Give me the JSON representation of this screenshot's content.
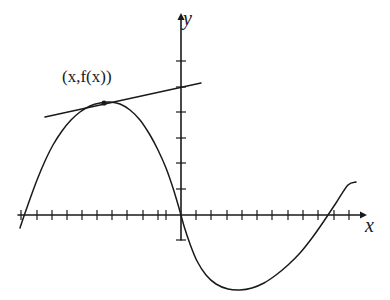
{
  "figure": {
    "background_color": "#ffffff",
    "stroke_color": "#1a1a1a",
    "width": 390,
    "height": 300
  },
  "axes": {
    "x_label": "x",
    "y_label": "y",
    "origin": {
      "x": 181,
      "y": 215
    },
    "x_axis": {
      "start_x": 18,
      "end_x": 360,
      "y": 215,
      "arrow": "right"
    },
    "y_axis": {
      "x": 181,
      "start_y": 240,
      "end_y": 20,
      "arrow": "up"
    },
    "tick_spacing_x": 15.2,
    "tick_spacing_y": 25.5,
    "x_ticks": [
      21,
      37,
      52,
      67,
      82,
      97,
      112,
      127,
      143,
      158,
      166,
      196,
      211,
      227,
      242,
      257,
      272,
      288,
      303,
      318,
      334,
      349
    ],
    "y_ticks_above_axis": [
      189,
      163,
      138,
      112,
      87,
      61
    ],
    "y_ticks_below_axis": [
      240
    ],
    "grid": false,
    "tick_labels": []
  },
  "annotations": {
    "point_label": "(x,f(x))",
    "point_marker": {
      "x": 104,
      "y": 103,
      "radius": 2.6
    },
    "tangent_line": {
      "x1": 45,
      "y1": 117,
      "x2": 201,
      "y2": 83
    }
  },
  "chart_data": {
    "type": "line",
    "title": "",
    "subtitle": "",
    "xlabel": "x",
    "ylabel": "y",
    "grid": false,
    "legend": [],
    "annotations": [
      {
        "text": "(x,f(x))",
        "x": 104,
        "y": 103,
        "kind": "point-label"
      }
    ],
    "series": [
      {
        "name": "f(x)",
        "kind": "curve",
        "points": [
          [
            20,
            228
          ],
          [
            24,
            216
          ],
          [
            30,
            199
          ],
          [
            37,
            180
          ],
          [
            45,
            161
          ],
          [
            53,
            145
          ],
          [
            62,
            131
          ],
          [
            71,
            120
          ],
          [
            80,
            112
          ],
          [
            90,
            106
          ],
          [
            100,
            103
          ],
          [
            110,
            102
          ],
          [
            120,
            104
          ],
          [
            130,
            110
          ],
          [
            140,
            120
          ],
          [
            150,
            135
          ],
          [
            158,
            150
          ],
          [
            166,
            168
          ],
          [
            173,
            188
          ],
          [
            179,
            208
          ],
          [
            184,
            226
          ],
          [
            190,
            244
          ],
          [
            197,
            261
          ],
          [
            206,
            275
          ],
          [
            216,
            284
          ],
          [
            228,
            289
          ],
          [
            240,
            290
          ],
          [
            252,
            288
          ],
          [
            264,
            283
          ],
          [
            276,
            275
          ],
          [
            288,
            265
          ],
          [
            300,
            253
          ],
          [
            312,
            238
          ],
          [
            324,
            221
          ],
          [
            336,
            203
          ],
          [
            348,
            185
          ],
          [
            356,
            182
          ]
        ]
      },
      {
        "name": "tangent",
        "kind": "line",
        "points": [
          [
            45,
            117
          ],
          [
            201,
            83
          ]
        ]
      }
    ]
  }
}
